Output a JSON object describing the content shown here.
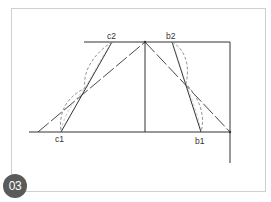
{
  "figure": {
    "badge_number": "03",
    "caption_partial": "",
    "labels": {
      "c2": "c2",
      "c1": "c1",
      "b2": "b2",
      "b1": "b1"
    },
    "colors": {
      "line": "#333333",
      "dashed_curve": "#888888",
      "frame_border": "#cfcfcf",
      "badge_bg": "#5a5a5a",
      "badge_text": "#ffffff"
    }
  }
}
